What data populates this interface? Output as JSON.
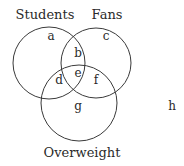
{
  "diagram": {
    "type": "venn",
    "sets": [
      {
        "name": "Students",
        "cx": 49,
        "cy": 63,
        "r": 36,
        "label_x": 45,
        "label_y": 19
      },
      {
        "name": "Fans",
        "cx": 96,
        "cy": 63,
        "r": 35,
        "label_x": 107,
        "label_y": 19
      },
      {
        "name": "Overweight",
        "cx": 79,
        "cy": 103,
        "r": 38,
        "label_x": 82,
        "label_y": 157
      }
    ],
    "regions": [
      {
        "label": "a",
        "x": 51,
        "y": 40
      },
      {
        "label": "b",
        "x": 78,
        "y": 57
      },
      {
        "label": "c",
        "x": 106,
        "y": 40
      },
      {
        "label": "d",
        "x": 59,
        "y": 84
      },
      {
        "label": "e",
        "x": 78,
        "y": 77
      },
      {
        "label": "f",
        "x": 96,
        "y": 84
      },
      {
        "label": "g",
        "x": 78,
        "y": 110
      },
      {
        "label": "h",
        "x": 172,
        "y": 110
      }
    ],
    "stroke_color": "#3a3a3a"
  }
}
